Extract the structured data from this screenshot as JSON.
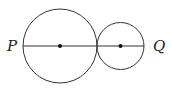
{
  "diagram": {
    "type": "geometry",
    "labels": {
      "left": "P",
      "right": "Q"
    },
    "circles": [
      {
        "name": "large",
        "cx": 60,
        "cy": 46,
        "r": 37
      },
      {
        "name": "small",
        "cx": 120.5,
        "cy": 46,
        "r": 23.5
      }
    ],
    "segment": {
      "x1": 23,
      "y1": 46,
      "x2": 144,
      "y2": 46
    },
    "colors": {
      "stroke": "#333333",
      "point": "#111111"
    }
  }
}
